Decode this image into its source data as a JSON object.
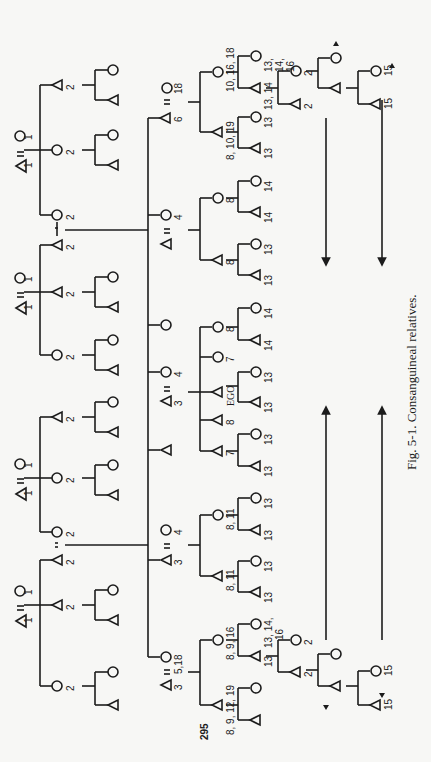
{
  "figure": {
    "caption": "Fig. 5-1.  Consanguineal relatives.",
    "page_number": "295",
    "ego_label": "EGO",
    "orientation": "rotated 90 degrees clockwise"
  },
  "legend": {
    "triangle": "male",
    "circle": "female",
    "equals": "marriage"
  },
  "labels": {
    "g1_a": {
      "m": "1",
      "f": "1"
    },
    "g1_b": {
      "m": "1",
      "f": "1"
    },
    "g1_c": {
      "m": "1",
      "f": "1"
    },
    "g1_d": {
      "m": "1",
      "f": "1"
    },
    "two": "2",
    "father": "6",
    "father_wife": "18",
    "ms_sis_husb": "3",
    "four": "4",
    "three": "3",
    "mother_sib_f": "5,18",
    "eight": "8",
    "seven": "7",
    "thirteen": "13",
    "fourteen": "14",
    "fifteen": "15",
    "eight_eleven": "8, 11",
    "fs_d_label": "10, 16, 18",
    "fs_s_label": "8, 10, 19",
    "fs_dd_label_1": "13,",
    "fs_dd_label_2": "14,",
    "fs_dd_label_3": "16",
    "fs_ds_label": "13, 14",
    "mb_d_label": "8, 9, 16",
    "mb_s_label": "8, 9, 12, 19",
    "mb_dd_label_1": "13, 14,",
    "mb_dd_label_2": "16",
    "mb_ds_label": "13"
  }
}
